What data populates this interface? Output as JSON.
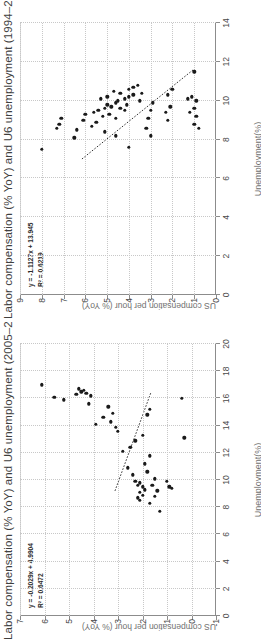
{
  "charts": [
    {
      "id": "chart-1994-2005",
      "title": "Labor compensation (% YoY) and U6 unemployment (1994–2005)",
      "xlabel": "Unemployment(%)",
      "ylabel": "US compensation per hour (% YoY)",
      "equation": "y = -1.1127x + 13.945",
      "r2": "R² = 0.6219",
      "xticks": [
        "0",
        "2",
        "4",
        "6",
        "8",
        "10",
        "12",
        "14"
      ],
      "yticks": [
        "0",
        "1",
        "2",
        "3",
        "4",
        "5",
        "6",
        "7",
        "8",
        "9"
      ]
    },
    {
      "id": "chart-2005-2019",
      "title": "Labor compensation (% YoY) and U6 unemployment (2005–2019)",
      "xlabel": "Unemployment(%)",
      "ylabel": "US compensation per hour (% YoY)",
      "equation": "y = -0.2029x + 4.9904",
      "r2": "R² = 0.6472",
      "xticks": [
        "0",
        "2",
        "4",
        "6",
        "8",
        "10",
        "12",
        "14",
        "16",
        "18",
        "20"
      ],
      "yticks": [
        "-1",
        "0",
        "1",
        "2",
        "3",
        "4",
        "5",
        "6",
        "7"
      ]
    }
  ],
  "chart_data": [
    {
      "type": "scatter",
      "title": "Labor compensation (% YoY) and U6 unemployment (1994–2005)",
      "xlabel": "Unemployment(%)",
      "ylabel": "US compensation per hour (% YoY)",
      "xlim": [
        0,
        14
      ],
      "ylim": [
        0,
        9
      ],
      "grid": true,
      "legend": "none",
      "annotations": [
        "y = -1.1127x + 13.945",
        "R² = 0.6219"
      ],
      "trendline": {
        "slope": -1.1127,
        "intercept": 13.945,
        "r2": 0.6219,
        "x_from": 7.0,
        "x_to": 11.6,
        "style": "dotted"
      },
      "points": [
        {
          "x": 7.5,
          "y": 8.0
        },
        {
          "x": 8.6,
          "y": 7.3
        },
        {
          "x": 8.8,
          "y": 7.2
        },
        {
          "x": 9.1,
          "y": 7.1
        },
        {
          "x": 8.1,
          "y": 6.5
        },
        {
          "x": 8.5,
          "y": 6.4
        },
        {
          "x": 9.0,
          "y": 6.1
        },
        {
          "x": 9.3,
          "y": 6.0
        },
        {
          "x": 9.4,
          "y": 5.6
        },
        {
          "x": 9.2,
          "y": 5.2
        },
        {
          "x": 9.5,
          "y": 5.4
        },
        {
          "x": 9.6,
          "y": 5.1
        },
        {
          "x": 9.8,
          "y": 5.0
        },
        {
          "x": 9.7,
          "y": 4.8
        },
        {
          "x": 9.9,
          "y": 4.6
        },
        {
          "x": 9.6,
          "y": 4.4
        },
        {
          "x": 9.5,
          "y": 4.2
        },
        {
          "x": 9.8,
          "y": 4.1
        },
        {
          "x": 10.0,
          "y": 4.5
        },
        {
          "x": 10.1,
          "y": 4.2
        },
        {
          "x": 10.2,
          "y": 4.0
        },
        {
          "x": 10.3,
          "y": 3.8
        },
        {
          "x": 10.5,
          "y": 4.7
        },
        {
          "x": 10.4,
          "y": 4.4
        },
        {
          "x": 10.6,
          "y": 4.0
        },
        {
          "x": 10.7,
          "y": 3.8
        },
        {
          "x": 10.8,
          "y": 3.6
        },
        {
          "x": 10.2,
          "y": 5.0
        },
        {
          "x": 10.1,
          "y": 5.3
        },
        {
          "x": 9.3,
          "y": 4.9
        },
        {
          "x": 9.1,
          "y": 4.6
        },
        {
          "x": 8.9,
          "y": 5.5
        },
        {
          "x": 8.7,
          "y": 5.7
        },
        {
          "x": 8.4,
          "y": 5.1
        },
        {
          "x": 8.2,
          "y": 4.6
        },
        {
          "x": 10.4,
          "y": 3.4
        },
        {
          "x": 10.0,
          "y": 3.5
        },
        {
          "x": 11.5,
          "y": 1.0
        },
        {
          "x": 10.2,
          "y": 1.1
        },
        {
          "x": 10.1,
          "y": 1.3
        },
        {
          "x": 10.0,
          "y": 0.9
        },
        {
          "x": 9.6,
          "y": 1.0
        },
        {
          "x": 9.4,
          "y": 1.2
        },
        {
          "x": 9.2,
          "y": 0.9
        },
        {
          "x": 8.8,
          "y": 1.0
        },
        {
          "x": 8.6,
          "y": 0.8
        },
        {
          "x": 9.9,
          "y": 2.9
        },
        {
          "x": 9.5,
          "y": 3.0
        },
        {
          "x": 9.1,
          "y": 3.1
        },
        {
          "x": 8.6,
          "y": 3.2
        },
        {
          "x": 8.2,
          "y": 3.0
        },
        {
          "x": 7.6,
          "y": 4.0
        },
        {
          "x": 9.0,
          "y": 2.2
        },
        {
          "x": 9.4,
          "y": 2.3
        },
        {
          "x": 9.7,
          "y": 2.1
        },
        {
          "x": 10.3,
          "y": 2.2
        },
        {
          "x": 10.6,
          "y": 2.0
        }
      ]
    },
    {
      "type": "scatter",
      "title": "Labor compensation (% YoY) and U6 unemployment (2005–2019)",
      "xlabel": "Unemployment(%)",
      "ylabel": "US compensation per hour (% YoY)",
      "xlim": [
        0,
        20
      ],
      "ylim": [
        -1,
        7
      ],
      "grid": true,
      "legend": "none",
      "annotations": [
        "y = -0.2029x + 4.9904",
        "R² = 0.6472"
      ],
      "trendline": {
        "slope": -0.2029,
        "intercept": 4.9904,
        "x_from": 9.2,
        "x_to": 16.4,
        "style": "dotted"
      },
      "points": [
        {
          "x": 17.0,
          "y": 6.1
        },
        {
          "x": 16.1,
          "y": 5.6
        },
        {
          "x": 15.9,
          "y": 5.2
        },
        {
          "x": 16.3,
          "y": 4.7
        },
        {
          "x": 16.5,
          "y": 4.5
        },
        {
          "x": 16.4,
          "y": 4.3
        },
        {
          "x": 16.2,
          "y": 4.1
        },
        {
          "x": 15.6,
          "y": 4.2
        },
        {
          "x": 14.1,
          "y": 3.9
        },
        {
          "x": 14.6,
          "y": 3.6
        },
        {
          "x": 14.3,
          "y": 3.3
        },
        {
          "x": 13.9,
          "y": 3.1
        },
        {
          "x": 13.6,
          "y": 3.0
        },
        {
          "x": 12.1,
          "y": 2.8
        },
        {
          "x": 10.9,
          "y": 2.6
        },
        {
          "x": 10.4,
          "y": 2.4
        },
        {
          "x": 9.9,
          "y": 2.3
        },
        {
          "x": 9.6,
          "y": 2.2
        },
        {
          "x": 9.8,
          "y": 2.1
        },
        {
          "x": 9.5,
          "y": 2.0
        },
        {
          "x": 9.3,
          "y": 1.9
        },
        {
          "x": 9.1,
          "y": 2.1
        },
        {
          "x": 8.9,
          "y": 2.0
        },
        {
          "x": 8.7,
          "y": 2.2
        },
        {
          "x": 8.5,
          "y": 2.1
        },
        {
          "x": 8.3,
          "y": 1.7
        },
        {
          "x": 8.8,
          "y": 1.5
        },
        {
          "x": 9.2,
          "y": 1.4
        },
        {
          "x": 9.6,
          "y": 1.6
        },
        {
          "x": 10.1,
          "y": 1.5
        },
        {
          "x": 10.6,
          "y": 1.8
        },
        {
          "x": 11.2,
          "y": 1.9
        },
        {
          "x": 11.8,
          "y": 1.7
        },
        {
          "x": 12.4,
          "y": 2.5
        },
        {
          "x": 12.9,
          "y": 2.3
        },
        {
          "x": 13.3,
          "y": 2.0
        },
        {
          "x": 14.8,
          "y": 1.8
        },
        {
          "x": 15.2,
          "y": 1.7
        },
        {
          "x": 16.0,
          "y": 0.4
        },
        {
          "x": 13.1,
          "y": 0.3
        },
        {
          "x": 9.9,
          "y": 1.0
        },
        {
          "x": 9.5,
          "y": 0.9
        },
        {
          "x": 9.4,
          "y": 0.8
        },
        {
          "x": 7.7,
          "y": 1.3
        },
        {
          "x": 16.6,
          "y": 4.4
        },
        {
          "x": 16.7,
          "y": 4.6
        },
        {
          "x": 15.4,
          "y": 3.4
        },
        {
          "x": 14.9,
          "y": 3.2
        }
      ]
    }
  ]
}
